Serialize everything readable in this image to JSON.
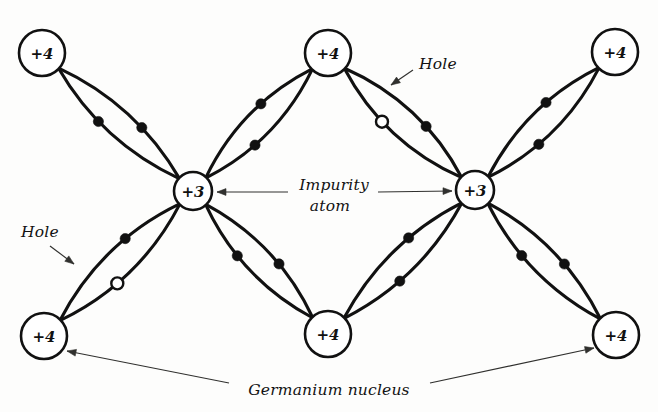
{
  "figure": {
    "background_color": "#fdfdfc",
    "ink_color": "#111111"
  },
  "nuclei": [
    {
      "id": "ge-top-left",
      "label": "+4",
      "kind": "germanium",
      "cx": 42,
      "cy": 53,
      "r": 23
    },
    {
      "id": "ge-top-center",
      "label": "+4",
      "kind": "germanium",
      "cx": 328,
      "cy": 53,
      "r": 23
    },
    {
      "id": "ge-top-right",
      "label": "+4",
      "kind": "germanium",
      "cx": 615,
      "cy": 52,
      "r": 23
    },
    {
      "id": "imp-left",
      "label": "+3",
      "kind": "impurity",
      "cx": 193,
      "cy": 191,
      "r": 19
    },
    {
      "id": "imp-right",
      "label": "+3",
      "kind": "impurity",
      "cx": 475,
      "cy": 190,
      "r": 19
    },
    {
      "id": "ge-bottom-left",
      "label": "+4",
      "kind": "germanium",
      "cx": 44,
      "cy": 336,
      "r": 23
    },
    {
      "id": "ge-bottom-center",
      "label": "+4",
      "kind": "germanium",
      "cx": 328,
      "cy": 334,
      "r": 23
    },
    {
      "id": "ge-bottom-right",
      "label": "+4",
      "kind": "germanium",
      "cx": 616,
      "cy": 335,
      "r": 23
    }
  ],
  "bonds": [
    {
      "id": "bond-tl-impleft",
      "from": "ge-top-left",
      "to": "imp-left",
      "bulge": 13,
      "carriers": [
        "electron",
        "electron"
      ]
    },
    {
      "id": "bond-tc-impleft",
      "from": "ge-top-center",
      "to": "imp-left",
      "bulge": 13,
      "carriers": [
        "electron",
        "electron"
      ]
    },
    {
      "id": "bond-tc-impright",
      "from": "ge-top-center",
      "to": "imp-right",
      "bulge": 14,
      "carriers": [
        "hole",
        "electron"
      ]
    },
    {
      "id": "bond-tr-impright",
      "from": "ge-top-right",
      "to": "imp-right",
      "bulge": 13,
      "carriers": [
        "electron",
        "electron"
      ]
    },
    {
      "id": "bond-bl-impleft",
      "from": "ge-bottom-left",
      "to": "imp-left",
      "bulge": 14,
      "carriers": [
        "hole",
        "electron"
      ]
    },
    {
      "id": "bond-bc-impleft",
      "from": "ge-bottom-center",
      "to": "imp-left",
      "bulge": 13,
      "carriers": [
        "electron",
        "electron"
      ]
    },
    {
      "id": "bond-bc-impright",
      "from": "ge-bottom-center",
      "to": "imp-right",
      "bulge": 13,
      "carriers": [
        "electron",
        "electron"
      ]
    },
    {
      "id": "bond-br-impright",
      "from": "ge-bottom-right",
      "to": "imp-right",
      "bulge": 13,
      "carriers": [
        "electron",
        "electron"
      ]
    }
  ],
  "annotations": [
    {
      "id": "label-hole-top",
      "text": "Hole",
      "x": 438,
      "y": 64,
      "lines": [
        {
          "type": "arrow",
          "from": [
            413,
            70
          ],
          "to": [
            391,
            85
          ]
        }
      ]
    },
    {
      "id": "label-hole-bottom",
      "text": "Hole",
      "x": 40,
      "y": 232,
      "lines": [
        {
          "type": "arrow",
          "from": [
            50,
            246
          ],
          "to": [
            74,
            264
          ]
        }
      ]
    },
    {
      "id": "label-impurity-atom",
      "text_line1": "Impurity",
      "text_line2": "atom",
      "x": 334,
      "y": 185,
      "lines": [
        {
          "type": "arrow",
          "from": [
            288,
            192
          ],
          "to": [
            217,
            192
          ]
        },
        {
          "type": "arrow",
          "from": [
            378,
            192
          ],
          "to": [
            452,
            191
          ]
        }
      ]
    },
    {
      "id": "label-germanium-nucleus",
      "text": "Germanium nucleus",
      "x": 329,
      "y": 390,
      "lines": [
        {
          "type": "arrow",
          "from": [
            229,
            383
          ],
          "to": [
            67,
            351
          ]
        },
        {
          "type": "arrow",
          "from": [
            430,
            383
          ],
          "to": [
            594,
            348
          ]
        }
      ]
    }
  ]
}
